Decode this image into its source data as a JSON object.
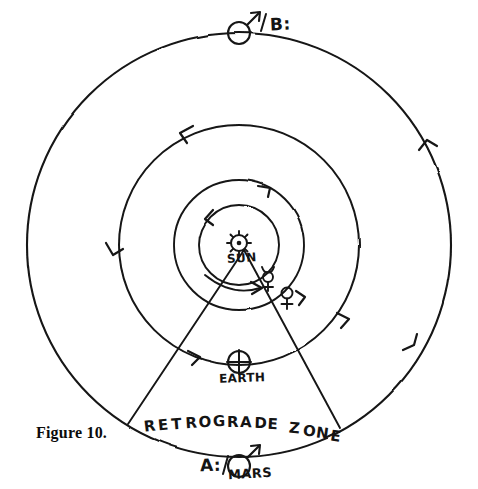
{
  "figure": {
    "caption": "Figure 10.",
    "background_color": "#ffffff",
    "ink_color": "#141414"
  },
  "center": {
    "x": 239,
    "y": 245
  },
  "orbits": [
    {
      "name": "mercury-orbit",
      "radius": 40,
      "direction": "counterclockwise"
    },
    {
      "name": "venus-orbit",
      "radius": 65,
      "direction": "counterclockwise"
    },
    {
      "name": "earth-orbit",
      "radius": 120,
      "direction": "counterclockwise"
    },
    {
      "name": "mars-orbit",
      "radius": 212,
      "direction": "counterclockwise"
    }
  ],
  "bodies": {
    "sun": {
      "label": "SUN",
      "symbol": "sun-symbol",
      "x": 239,
      "y": 243
    },
    "mercury": {
      "label": "",
      "symbol": "mercury-symbol",
      "x": 268,
      "y": 277
    },
    "venus": {
      "label": "",
      "symbol": "venus-symbol",
      "x": 287,
      "y": 293
    },
    "earth": {
      "label": "EARTH",
      "symbol": "earth-symbol",
      "x": 239,
      "y": 362
    },
    "mars_a": {
      "label": "MARS",
      "marker": "A:",
      "symbol": "mars-symbol",
      "x": 239,
      "y": 466
    },
    "mars_b": {
      "label": "",
      "marker": "B:",
      "symbol": "mars-symbol",
      "x": 239,
      "y": 33
    }
  },
  "annotations": {
    "position_a": "A:",
    "position_b": "B:",
    "retrograde_zone": "RETROGRADE ZONE",
    "sight_line_left_end": {
      "x": 128,
      "y": 424
    },
    "sight_line_right_end": {
      "x": 340,
      "y": 428
    },
    "axis_line": "vertical-dashed-axis"
  },
  "chart_data": {
    "type": "diagram",
    "title": "Figure 10.",
    "concentric_orbits": [
      {
        "body": "Mercury",
        "radius_px": 40
      },
      {
        "body": "Venus",
        "radius_px": 65
      },
      {
        "body": "Earth",
        "radius_px": 120
      },
      {
        "body": "Mars",
        "radius_px": 212
      }
    ],
    "orbit_direction": "counterclockwise",
    "marked_positions": [
      {
        "id": "A:",
        "body": "Mars",
        "location": "bottom of Mars orbit"
      },
      {
        "id": "B:",
        "body": "Mars",
        "location": "top of Mars orbit"
      }
    ],
    "labels": [
      "SUN",
      "EARTH",
      "MARS",
      "A:",
      "B:",
      "RETROGRADE ZONE"
    ]
  }
}
